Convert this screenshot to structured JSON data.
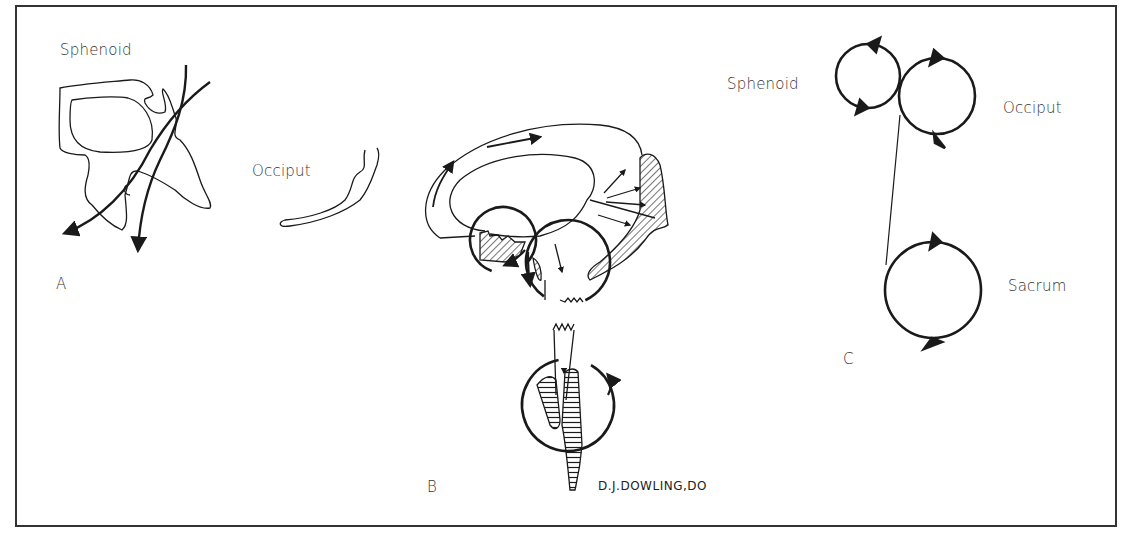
{
  "figure": {
    "panels": {
      "a": {
        "letter": "A",
        "labels": {
          "sphenoid": "Sphenoid",
          "occiput": "Occiput"
        }
      },
      "b": {
        "letter": "B",
        "signature": "D.J.DOWLING,DO"
      },
      "c": {
        "letter": "C",
        "labels": {
          "sphenoid": "Sphenoid",
          "occiput": "Occiput",
          "sacrum": "Sacrum"
        }
      }
    },
    "colors": {
      "ink": "#1a1a1a",
      "frame": "#333333",
      "background": "#ffffff"
    }
  }
}
